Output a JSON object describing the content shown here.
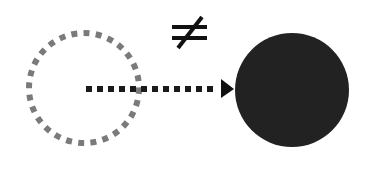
{
  "diagram": {
    "symbol": "≠",
    "colors": {
      "background": "#ffffff",
      "outline_circle": "#7a7a7a",
      "arrow": "#1a1a1a",
      "filled_circle": "#222222",
      "symbol": "#111111"
    },
    "nodes": [
      {
        "id": "empty-circle",
        "style": "dotted-outline",
        "cx": 84,
        "cy": 88,
        "r": 55
      },
      {
        "id": "filled-circle",
        "style": "solid-fill",
        "cx": 292,
        "cy": 90,
        "r": 57
      }
    ],
    "edges": [
      {
        "from": "empty-circle",
        "to": "filled-circle",
        "style": "dotted",
        "x1": 86,
        "y1": 89,
        "x2": 233,
        "y2": 89
      }
    ]
  }
}
